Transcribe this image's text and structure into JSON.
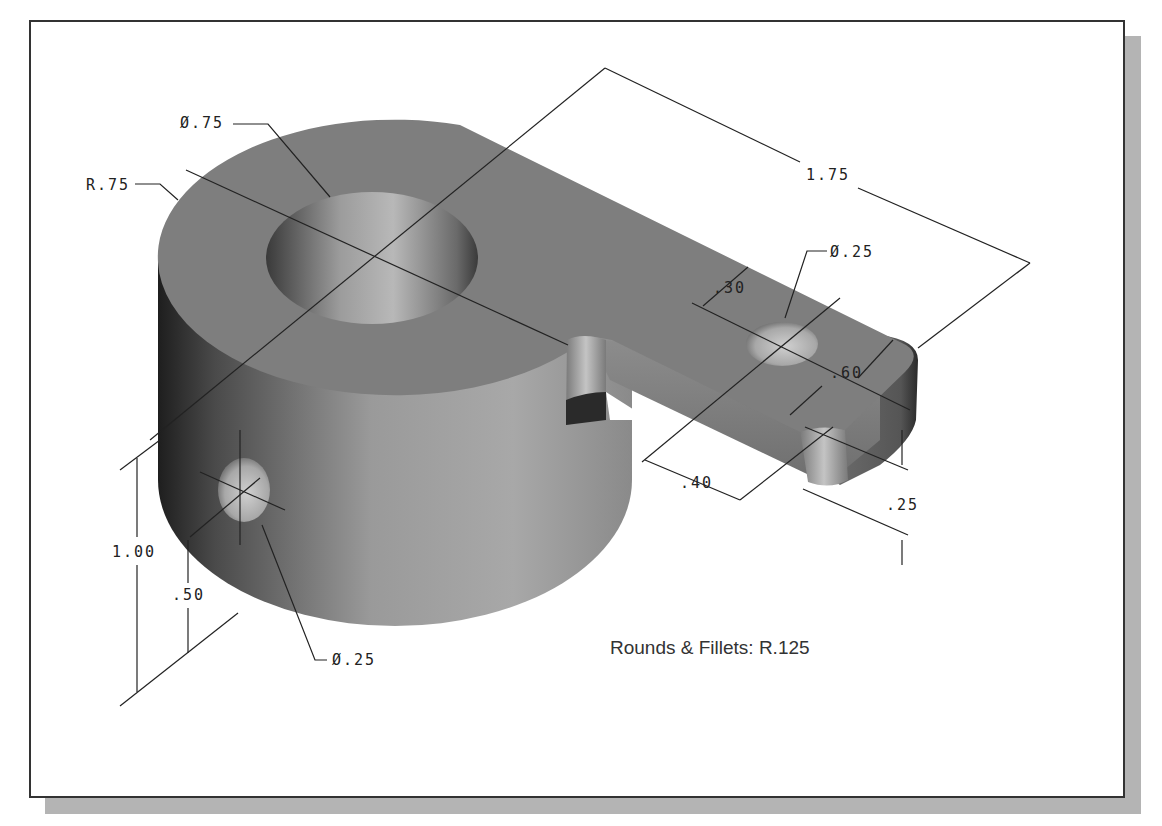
{
  "figure": {
    "type": "isometric part drawing",
    "frame": {
      "border_color": "#333333",
      "shadow_color": "#b4b4b4",
      "background": "#ffffff"
    },
    "part_colors": {
      "top_face": "#7e7e7e",
      "side_light": "#b0b0b0",
      "side_dark": "#2e2e2e",
      "hole_light": "#c8c8c8"
    }
  },
  "dimensions": {
    "main_bore_dia": "Ø.75",
    "outer_radius": "R.75",
    "center_distance": "1.75",
    "arm_hole_dia": "Ø.25",
    "arm_hole_offset": ".30",
    "arm_width": ".60",
    "arm_end_offset": ".40",
    "arm_thickness": ".25",
    "cylinder_height": "1.00",
    "side_hole_height": ".50",
    "side_hole_dia": "Ø.25"
  },
  "notes": {
    "rounds_fillets": "Rounds & Fillets: R.125"
  }
}
